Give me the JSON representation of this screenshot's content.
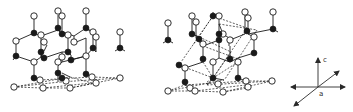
{
  "figure": {
    "panels": [
      {
        "id": "structure-left",
        "description": "Crystal lattice with open and filled atoms, dashed basal plane"
      },
      {
        "id": "structure-right",
        "description": "Crystal lattice with open and filled atoms, dashed bonds and basal plane"
      }
    ],
    "axes": {
      "c_label": "c",
      "a_label": "a"
    },
    "colors": {
      "ink": "#1a1a1a",
      "background": "#ffffff"
    }
  }
}
